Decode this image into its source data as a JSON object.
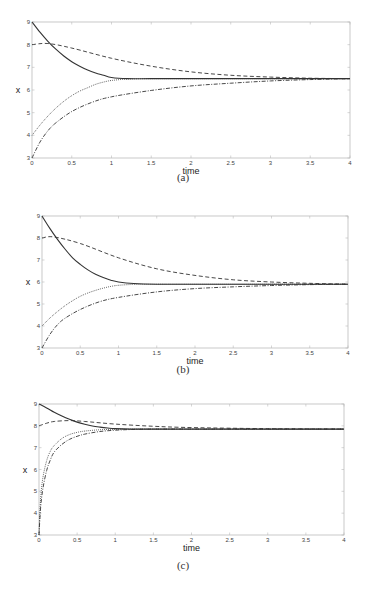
{
  "chart_data": [
    {
      "type": "line",
      "caption": "(a)",
      "xlabel": "time",
      "ylabel": "x",
      "xlim": [
        0,
        4
      ],
      "ylim": [
        3,
        9
      ],
      "xticks": [
        "0",
        "0.5",
        "1",
        "1.5",
        "2",
        "2.5",
        "3",
        "3.5",
        "4"
      ],
      "yticks": [
        "3",
        "4",
        "5",
        "6",
        "7",
        "8",
        "9"
      ],
      "grid": false,
      "legend": null,
      "series": [
        {
          "name": "solid",
          "style": "solid",
          "x": [
            0,
            0.1,
            0.2,
            0.3,
            0.4,
            0.5,
            0.6,
            0.7,
            0.8,
            0.9,
            1.0,
            1.2,
            1.5,
            2,
            2.5,
            3,
            3.5,
            4
          ],
          "values": [
            9,
            8.55,
            8.15,
            7.8,
            7.5,
            7.25,
            7.05,
            6.88,
            6.75,
            6.65,
            6.55,
            6.5,
            6.5,
            6.5,
            6.5,
            6.5,
            6.5,
            6.5
          ]
        },
        {
          "name": "dashed",
          "style": "dashed",
          "x": [
            0,
            0.2,
            0.5,
            1.0,
            1.5,
            2,
            2.5,
            3,
            3.5,
            4
          ],
          "values": [
            8,
            8.05,
            7.85,
            7.4,
            7.05,
            6.8,
            6.65,
            6.57,
            6.52,
            6.5
          ]
        },
        {
          "name": "dotted",
          "style": "dotted",
          "x": [
            0,
            0.1,
            0.2,
            0.3,
            0.4,
            0.5,
            0.6,
            0.7,
            0.8,
            0.9,
            1.0,
            1.2,
            1.5,
            2,
            3,
            4
          ],
          "values": [
            4,
            4.45,
            4.85,
            5.2,
            5.5,
            5.75,
            5.95,
            6.1,
            6.25,
            6.35,
            6.42,
            6.48,
            6.5,
            6.5,
            6.5,
            6.5
          ]
        },
        {
          "name": "dash-dot",
          "style": "dashdot",
          "x": [
            0,
            0.1,
            0.2,
            0.3,
            0.5,
            0.75,
            1.0,
            1.5,
            2,
            2.5,
            3,
            3.5,
            4
          ],
          "values": [
            3,
            3.7,
            4.2,
            4.55,
            5.05,
            5.45,
            5.7,
            5.98,
            6.18,
            6.3,
            6.4,
            6.46,
            6.5
          ]
        }
      ]
    },
    {
      "type": "line",
      "caption": "(b)",
      "xlabel": "time",
      "ylabel": "x",
      "xlim": [
        0,
        4
      ],
      "ylim": [
        3,
        9
      ],
      "xticks": [
        "0",
        "0.5",
        "1",
        "1.5",
        "2",
        "2.5",
        "3",
        "3.5",
        "4"
      ],
      "yticks": [
        "3",
        "4",
        "5",
        "6",
        "7",
        "8",
        "9"
      ],
      "grid": false,
      "legend": null,
      "series": [
        {
          "name": "solid",
          "style": "solid",
          "x": [
            0,
            0.1,
            0.2,
            0.3,
            0.4,
            0.5,
            0.6,
            0.7,
            0.8,
            0.9,
            1.0,
            1.2,
            1.5,
            2,
            3,
            4
          ],
          "values": [
            9,
            8.45,
            7.95,
            7.5,
            7.1,
            6.8,
            6.55,
            6.35,
            6.2,
            6.08,
            6.0,
            5.93,
            5.9,
            5.9,
            5.9,
            5.9
          ]
        },
        {
          "name": "dashed",
          "style": "dashed",
          "x": [
            0,
            0.15,
            0.5,
            1.0,
            1.5,
            2,
            2.5,
            3,
            3.5,
            4
          ],
          "values": [
            8,
            8.05,
            7.75,
            7.1,
            6.6,
            6.3,
            6.1,
            6.0,
            5.94,
            5.9
          ]
        },
        {
          "name": "dotted",
          "style": "dotted",
          "x": [
            0,
            0.1,
            0.2,
            0.3,
            0.4,
            0.5,
            0.6,
            0.7,
            0.8,
            0.9,
            1.0,
            1.2,
            1.5,
            2,
            4
          ],
          "values": [
            4,
            4.35,
            4.65,
            4.92,
            5.15,
            5.35,
            5.5,
            5.62,
            5.72,
            5.8,
            5.85,
            5.89,
            5.9,
            5.9,
            5.9
          ]
        },
        {
          "name": "dash-dot",
          "style": "dashdot",
          "x": [
            0,
            0.1,
            0.2,
            0.3,
            0.5,
            0.75,
            1.0,
            1.5,
            2,
            2.5,
            3,
            3.5,
            4
          ],
          "values": [
            3,
            3.6,
            4.05,
            4.35,
            4.75,
            5.1,
            5.3,
            5.55,
            5.7,
            5.78,
            5.84,
            5.88,
            5.9
          ]
        }
      ]
    },
    {
      "type": "line",
      "caption": "(c)",
      "xlabel": "time",
      "ylabel": "x",
      "xlim": [
        0,
        4
      ],
      "ylim": [
        3,
        9
      ],
      "xticks": [
        "0",
        "0.5",
        "1",
        "1.5",
        "2",
        "2.5",
        "3",
        "3.5",
        "4"
      ],
      "yticks": [
        "3",
        "4",
        "5",
        "6",
        "7",
        "8",
        "9"
      ],
      "grid": false,
      "legend": null,
      "series": [
        {
          "name": "solid",
          "style": "solid",
          "x": [
            0,
            0.1,
            0.2,
            0.3,
            0.4,
            0.5,
            0.6,
            0.7,
            0.8,
            0.9,
            1.0,
            1.2,
            1.5,
            2,
            4
          ],
          "values": [
            9,
            8.82,
            8.62,
            8.45,
            8.3,
            8.17,
            8.07,
            7.99,
            7.94,
            7.9,
            7.87,
            7.85,
            7.85,
            7.85,
            7.85
          ]
        },
        {
          "name": "dashed",
          "style": "dashed",
          "x": [
            0,
            0.1,
            0.2,
            0.4,
            0.6,
            1.0,
            1.5,
            2,
            3,
            4
          ],
          "values": [
            8,
            8.12,
            8.2,
            8.24,
            8.2,
            8.08,
            7.98,
            7.92,
            7.87,
            7.85
          ]
        },
        {
          "name": "dotted",
          "style": "dotted",
          "x": [
            0,
            0.02,
            0.05,
            0.1,
            0.15,
            0.2,
            0.3,
            0.4,
            0.5,
            0.6,
            0.8,
            1.0,
            1.2,
            1.5,
            2,
            4
          ],
          "values": [
            3,
            4.6,
            5.6,
            6.4,
            6.85,
            7.1,
            7.42,
            7.6,
            7.7,
            7.76,
            7.82,
            7.84,
            7.85,
            7.85,
            7.85,
            7.85
          ]
        },
        {
          "name": "dash-dot",
          "style": "dashdot",
          "x": [
            0,
            0.02,
            0.05,
            0.1,
            0.15,
            0.2,
            0.3,
            0.4,
            0.5,
            0.6,
            0.8,
            1.0,
            1.2,
            1.5,
            2,
            4
          ],
          "values": [
            3,
            4.2,
            5.1,
            5.95,
            6.45,
            6.8,
            7.15,
            7.38,
            7.52,
            7.62,
            7.74,
            7.8,
            7.83,
            7.85,
            7.85,
            7.85
          ]
        }
      ]
    }
  ],
  "layout": {
    "panels": [
      {
        "top": 0,
        "height": 198,
        "plot": {
          "left": 32,
          "top": 22,
          "right": 350,
          "bottom": 158
        },
        "caption_top": 177
      },
      {
        "top": 0,
        "height": 390,
        "plot": {
          "left": 42,
          "top": 216,
          "right": 348,
          "bottom": 348
        },
        "caption_top": 367
      },
      {
        "top": 0,
        "height": 590,
        "plot": {
          "left": 39,
          "top": 404,
          "right": 344,
          "bottom": 535
        },
        "caption_top": 565
      }
    ]
  },
  "captions": {
    "a": "(a)",
    "b": "(b)",
    "c": "(c)"
  },
  "colors": {
    "axis": "#bbbbbb",
    "line": "#333333",
    "tick_text": "#444444"
  }
}
